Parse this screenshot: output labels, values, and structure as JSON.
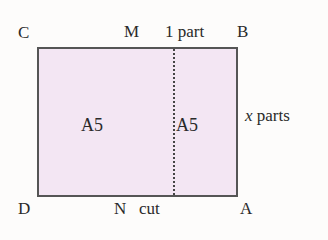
{
  "diagram": {
    "corners": {
      "C": "C",
      "B": "B",
      "D": "D",
      "A": "A"
    },
    "midpoints": {
      "M": "M",
      "N": "N"
    },
    "top_annotation": "1 part",
    "bottom_annotation": "cut",
    "side_annotation": {
      "variable": "x",
      "text": "parts"
    },
    "regions": [
      "A5",
      "A5"
    ],
    "colors": {
      "fill": "#f3e6f3",
      "border": "#555555",
      "fold_line": "#444444"
    }
  }
}
